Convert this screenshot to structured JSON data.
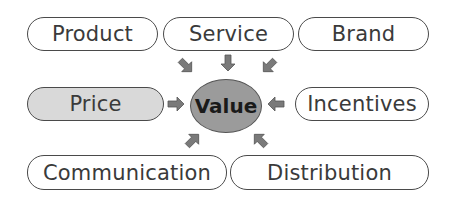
{
  "diagram": {
    "center": {
      "label": "Value",
      "fill": "#9b9b9b"
    },
    "nodes": [
      {
        "id": "product",
        "label": "Product"
      },
      {
        "id": "service",
        "label": "Service"
      },
      {
        "id": "brand",
        "label": "Brand"
      },
      {
        "id": "price",
        "label": "Price",
        "fill": "#d9d9d9"
      },
      {
        "id": "incentives",
        "label": "Incentives"
      },
      {
        "id": "communication",
        "label": "Communication"
      },
      {
        "id": "distribution",
        "label": "Distribution"
      }
    ],
    "arrow_color": "#7a7a7a"
  }
}
